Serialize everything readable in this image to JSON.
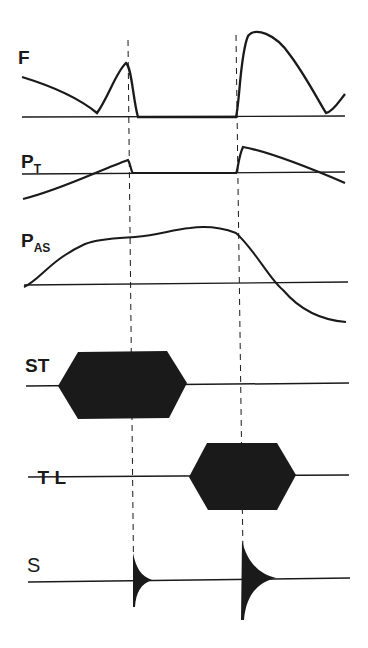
{
  "diagram": {
    "traces": [
      {
        "id": "F",
        "label": "F",
        "sub": ""
      },
      {
        "id": "PT",
        "label": "P",
        "sub": "T"
      },
      {
        "id": "PAS",
        "label": "P",
        "sub": "AS"
      },
      {
        "id": "ST",
        "label": "ST",
        "sub": ""
      },
      {
        "id": "TL",
        "label": "T L",
        "sub": ""
      },
      {
        "id": "S",
        "label": "S",
        "sub": ""
      }
    ],
    "markers": {
      "count": 2,
      "style": "dashed vertical lines"
    },
    "colors": {
      "ink": "#1a1a1a",
      "background": "#ffffff"
    }
  }
}
